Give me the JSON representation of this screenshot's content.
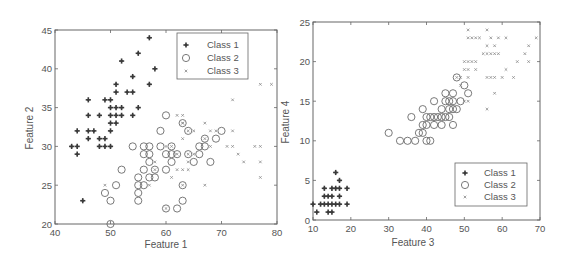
{
  "chart_data": [
    {
      "type": "scatter",
      "title": "",
      "xlabel": "Feature 1",
      "ylabel": "Feature 2",
      "xlim": [
        40,
        80
      ],
      "ylim": [
        20,
        45
      ],
      "xticks": [
        "40",
        "50",
        "60",
        "70",
        "80"
      ],
      "yticks": [
        "20",
        "25",
        "30",
        "35",
        "40",
        "45"
      ],
      "grid": false,
      "legend_position": "upper right",
      "series": [
        {
          "name": "Class 1",
          "marker": "star",
          "points": [
            [
              57,
              44
            ],
            [
              55,
              42
            ],
            [
              52,
              41
            ],
            [
              58,
              40
            ],
            [
              54,
              39
            ],
            [
              51,
              38
            ],
            [
              57,
              38
            ],
            [
              51,
              37
            ],
            [
              53,
              37
            ],
            [
              54,
              37
            ],
            [
              46,
              36
            ],
            [
              49,
              36
            ],
            [
              50,
              36
            ],
            [
              50,
              35
            ],
            [
              51,
              35
            ],
            [
              52,
              35
            ],
            [
              55,
              35
            ],
            [
              46,
              34
            ],
            [
              48,
              34
            ],
            [
              50,
              34
            ],
            [
              51,
              34
            ],
            [
              52,
              34
            ],
            [
              54,
              34
            ],
            [
              50,
              33
            ],
            [
              51,
              33
            ],
            [
              44,
              32
            ],
            [
              46,
              32
            ],
            [
              47,
              32
            ],
            [
              50,
              32
            ],
            [
              46,
              31
            ],
            [
              48,
              31
            ],
            [
              49,
              31
            ],
            [
              43,
              30
            ],
            [
              44,
              30
            ],
            [
              48,
              30
            ],
            [
              49,
              30
            ],
            [
              50,
              30
            ],
            [
              44,
              29
            ],
            [
              45,
              23
            ]
          ]
        },
        {
          "name": "Class 2",
          "marker": "circle",
          "points": [
            [
              60,
              34
            ],
            [
              63,
              33
            ],
            [
              59,
              32
            ],
            [
              64,
              32
            ],
            [
              70,
              32
            ],
            [
              67,
              31
            ],
            [
              69,
              31
            ],
            [
              54,
              30
            ],
            [
              56,
              30
            ],
            [
              57,
              30
            ],
            [
              59,
              30
            ],
            [
              61,
              30
            ],
            [
              66,
              30
            ],
            [
              67,
              30
            ],
            [
              56,
              29
            ],
            [
              57,
              29
            ],
            [
              60,
              29
            ],
            [
              61,
              29
            ],
            [
              62,
              29
            ],
            [
              64,
              29
            ],
            [
              66,
              29
            ],
            [
              57,
              28
            ],
            [
              61,
              28
            ],
            [
              65,
              28
            ],
            [
              68,
              28
            ],
            [
              52,
              27
            ],
            [
              56,
              27
            ],
            [
              58,
              27
            ],
            [
              60,
              27
            ],
            [
              55,
              26
            ],
            [
              57,
              26
            ],
            [
              58,
              26
            ],
            [
              51,
              25
            ],
            [
              55,
              25
            ],
            [
              56,
              25
            ],
            [
              63,
              25
            ],
            [
              49,
              24
            ],
            [
              55,
              24
            ],
            [
              50,
              23
            ],
            [
              55,
              23
            ],
            [
              63,
              23
            ],
            [
              60,
              22
            ],
            [
              62,
              22
            ],
            [
              50,
              20
            ]
          ]
        },
        {
          "name": "Class 3",
          "marker": "x",
          "points": [
            [
              77,
              38
            ],
            [
              79,
              38
            ],
            [
              72,
              36
            ],
            [
              62,
              34
            ],
            [
              63,
              34
            ],
            [
              67,
              33
            ],
            [
              63,
              33
            ],
            [
              64,
              32
            ],
            [
              65,
              32
            ],
            [
              68,
              32
            ],
            [
              69,
              32
            ],
            [
              72,
              32
            ],
            [
              63,
              31
            ],
            [
              67,
              31
            ],
            [
              68,
              30
            ],
            [
              71,
              30
            ],
            [
              72,
              30
            ],
            [
              76,
              30
            ],
            [
              77,
              30
            ],
            [
              60,
              30
            ],
            [
              61,
              30
            ],
            [
              73,
              29
            ],
            [
              62,
              29
            ],
            [
              64,
              29
            ],
            [
              65,
              29
            ],
            [
              58,
              28
            ],
            [
              64,
              28
            ],
            [
              74,
              28
            ],
            [
              77,
              28
            ],
            [
              58,
              27
            ],
            [
              62,
              27
            ],
            [
              64,
              27
            ],
            [
              63,
              27
            ],
            [
              61,
              26
            ],
            [
              77,
              26
            ],
            [
              57,
              25
            ],
            [
              63,
              25
            ],
            [
              67,
              25
            ],
            [
              49,
              25
            ],
            [
              60,
              22
            ],
            [
              63,
              33
            ]
          ]
        }
      ]
    },
    {
      "type": "scatter",
      "title": "",
      "xlabel": "Feature 3",
      "ylabel": "Feature 4",
      "xlim": [
        10,
        70
      ],
      "ylim": [
        0,
        25
      ],
      "xticks": [
        "10",
        "20",
        "30",
        "40",
        "50",
        "60",
        "70"
      ],
      "yticks": [
        "0",
        "5",
        "10",
        "15",
        "20",
        "25"
      ],
      "grid": false,
      "legend_position": "lower right",
      "series": [
        {
          "name": "Class 1",
          "marker": "star",
          "points": [
            [
              16,
              6
            ],
            [
              17,
              5
            ],
            [
              13,
              4
            ],
            [
              15,
              4
            ],
            [
              16,
              4
            ],
            [
              17,
              4
            ],
            [
              19,
              4
            ],
            [
              13,
              3
            ],
            [
              14,
              3
            ],
            [
              15,
              3
            ],
            [
              17,
              3
            ],
            [
              10,
              2
            ],
            [
              12,
              2
            ],
            [
              13,
              2
            ],
            [
              14,
              2
            ],
            [
              15,
              2
            ],
            [
              16,
              2
            ],
            [
              17,
              2
            ],
            [
              19,
              2
            ],
            [
              11,
              1
            ],
            [
              14,
              1
            ],
            [
              15,
              1
            ]
          ]
        },
        {
          "name": "Class 2",
          "marker": "circle",
          "points": [
            [
              48,
              18
            ],
            [
              50,
              17
            ],
            [
              45,
              16
            ],
            [
              47,
              16
            ],
            [
              51,
              16
            ],
            [
              42,
              15
            ],
            [
              45,
              15
            ],
            [
              46,
              15
            ],
            [
              47,
              15
            ],
            [
              49,
              15
            ],
            [
              39,
              14
            ],
            [
              44,
              14
            ],
            [
              46,
              14
            ],
            [
              47,
              14
            ],
            [
              48,
              14
            ],
            [
              36,
              13
            ],
            [
              40,
              13
            ],
            [
              41,
              13
            ],
            [
              42,
              13
            ],
            [
              43,
              13
            ],
            [
              44,
              13
            ],
            [
              45,
              13
            ],
            [
              46,
              13
            ],
            [
              39,
              12
            ],
            [
              40,
              12
            ],
            [
              42,
              12
            ],
            [
              44,
              12
            ],
            [
              47,
              12
            ],
            [
              38,
              11
            ],
            [
              39,
              11
            ],
            [
              30,
              11
            ],
            [
              33,
              10
            ],
            [
              35,
              10
            ],
            [
              37,
              10
            ],
            [
              40,
              10
            ],
            [
              41,
              10
            ]
          ]
        },
        {
          "name": "Class 3",
          "marker": "x",
          "points": [
            [
              51,
              24
            ],
            [
              56,
              24
            ],
            [
              51,
              23
            ],
            [
              52,
              23
            ],
            [
              53,
              23
            ],
            [
              54,
              23
            ],
            [
              57,
              23
            ],
            [
              59,
              23
            ],
            [
              61,
              23
            ],
            [
              69,
              23
            ],
            [
              56,
              22
            ],
            [
              58,
              22
            ],
            [
              67,
              22
            ],
            [
              55,
              21
            ],
            [
              56,
              21
            ],
            [
              57,
              21
            ],
            [
              58,
              21
            ],
            [
              59,
              21
            ],
            [
              66,
              21
            ],
            [
              50,
              20
            ],
            [
              51,
              20
            ],
            [
              52,
              20
            ],
            [
              53,
              20
            ],
            [
              64,
              20
            ],
            [
              67,
              20
            ],
            [
              50,
              19
            ],
            [
              51,
              19
            ],
            [
              53,
              19
            ],
            [
              61,
              19
            ],
            [
              48,
              18
            ],
            [
              49,
              18
            ],
            [
              51,
              18
            ],
            [
              56,
              18
            ],
            [
              57,
              18
            ],
            [
              58,
              18
            ],
            [
              60,
              18
            ],
            [
              63,
              18
            ],
            [
              49,
              17
            ],
            [
              58,
              16
            ],
            [
              50,
              15
            ],
            [
              51,
              15
            ],
            [
              56,
              14
            ]
          ]
        }
      ]
    }
  ],
  "panels": [
    {
      "xlabel": "Feature 1",
      "ylabel": "Feature 2",
      "xticks": [
        "40",
        "50",
        "60",
        "70",
        "80"
      ],
      "yticks": [
        "20",
        "25",
        "30",
        "35",
        "40",
        "45"
      ],
      "legend": [
        "Class 1",
        "Class 2",
        "Class 3"
      ]
    },
    {
      "xlabel": "Feature 3",
      "ylabel": "Feature 4",
      "xticks": [
        "10",
        "20",
        "30",
        "40",
        "50",
        "60",
        "70"
      ],
      "yticks": [
        "0",
        "5",
        "10",
        "15",
        "20",
        "25"
      ],
      "legend": [
        "Class 1",
        "Class 2",
        "Class 3"
      ]
    }
  ],
  "colors": {
    "class1": "#3a3a3a",
    "class2": "#6a6a6a",
    "class3": "#8a8a8a",
    "axis": "#555555",
    "text": "#555555"
  }
}
